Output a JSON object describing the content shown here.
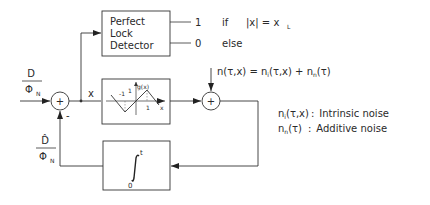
{
  "diagram": {
    "title": "",
    "input": {
      "numerator": "D",
      "denominator": "Φ",
      "denominator_sub": "N"
    },
    "feedback": {
      "numerator": "D̂",
      "denominator": "Φ",
      "denominator_sub": "N"
    },
    "left_sum": {
      "symbol": "+",
      "minus_sign": "-"
    },
    "error_signal": "x",
    "lock_detector": {
      "lines": [
        "Perfect",
        "Lock",
        "Detector"
      ],
      "output_high": "1",
      "output_low": "0",
      "condition_high": "if",
      "condition_expr": "|x| = x",
      "condition_sub": "L",
      "condition_low": "else"
    },
    "nonlinearity": {
      "ylabel": "g(x)",
      "xlabel": "x",
      "tick_neg": "-1",
      "tick_pos_y": "1",
      "tick_pos_x": "1"
    },
    "right_sum": {
      "symbol": "+"
    },
    "noise": {
      "expr_main": "n(τ,x) = n",
      "expr_sub1": "i",
      "expr_mid": "(τ,x) + n",
      "expr_sub2": "n",
      "expr_end": "(τ)"
    },
    "integrator": {
      "upper": "t",
      "lower": "0"
    },
    "legend": [
      {
        "sym": "n",
        "sub": "i",
        "args": "(τ,x)",
        "sep": ":",
        "desc": "Intrinsic noise"
      },
      {
        "sym": "n",
        "sub": "n",
        "args": "(τ)",
        "sep": ":",
        "desc": "Additive noise"
      }
    ]
  }
}
